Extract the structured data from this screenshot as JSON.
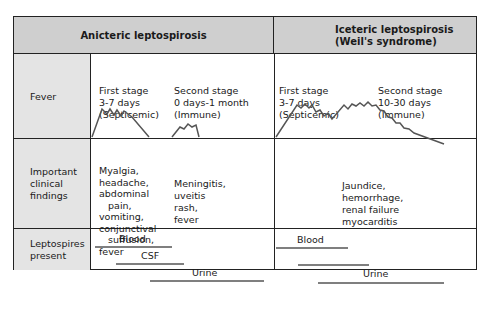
{
  "headers": {
    "anicteric": "Anicteric leptospirosis",
    "icteric_line1": "Iceteric leptospirosis",
    "icteric_line2": "(Weil's syndrome)"
  },
  "rows": {
    "fever": {
      "label": "Fever",
      "anicteric": {
        "first_stage": [
          "First stage",
          "3-7 days",
          "(Septicemic)"
        ],
        "second_stage": [
          "Second stage",
          "0 days-1 month",
          "(Immune)"
        ]
      },
      "icteric": {
        "first_stage": [
          "First stage",
          "3-7 days",
          "(Septicemic)"
        ],
        "second_stage": [
          "Second stage",
          "10-30 days",
          "(Immune)"
        ]
      }
    },
    "findings": {
      "label_lines": [
        "Important",
        "clinical",
        "findings"
      ],
      "anicteric_first": [
        "Myalgia,",
        "headache,",
        "abdominal",
        "   pain,",
        "vomiting,",
        "conjunctival",
        "   suffusion,",
        "fever"
      ],
      "anicteric_second": [
        "Meningitis,",
        "uveitis",
        "rash,",
        "fever"
      ],
      "icteric": [
        "Jaundice,",
        "hemorrhage,",
        "renal failure",
        "myocarditis"
      ]
    },
    "leptospires": {
      "label_lines": [
        "Leptospires",
        "present"
      ],
      "anicteric": {
        "blood": "Blood",
        "csf": "CSF",
        "urine": "Urine"
      },
      "icteric": {
        "blood": "Blood",
        "urine": "Urine"
      }
    }
  },
  "colors": {
    "header_bg": "#cfcfcf",
    "label_bg": "#e4e4e4",
    "line": "#555555"
  }
}
